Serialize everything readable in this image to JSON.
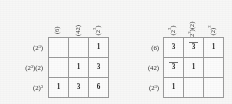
{
  "document": {
    "kind": "mathematical-matrix-pair",
    "notation": "integer-partition-cycle-type"
  },
  "matrices": [
    {
      "id": "left",
      "name": "left-matrix",
      "column_headers": [
        "(6)",
        "(42)",
        "(2³)"
      ],
      "row_labels": [
        "(2³)",
        "(2³)(2)",
        "(2)³"
      ],
      "cells": [
        [
          "",
          "",
          "1"
        ],
        [
          "",
          "1",
          "3"
        ],
        [
          "1",
          "3",
          "6"
        ]
      ],
      "struck": [
        [
          false,
          false,
          false
        ],
        [
          false,
          false,
          false
        ],
        [
          false,
          false,
          false
        ]
      ]
    },
    {
      "id": "right",
      "name": "right-matrix",
      "column_headers": [
        "(2³)",
        "(2³)(2)",
        "(2)³"
      ],
      "row_labels": [
        "(6)",
        "(42)",
        "(2³)"
      ],
      "cells": [
        [
          "3",
          "3",
          "1"
        ],
        [
          "3",
          "1",
          ""
        ],
        [
          "1",
          "",
          ""
        ]
      ],
      "struck": [
        [
          false,
          true,
          false
        ],
        [
          true,
          false,
          false
        ],
        [
          false,
          false,
          false
        ]
      ]
    }
  ],
  "chart_data": {
    "type": "table",
    "title": "",
    "tables": [
      {
        "name": "left-matrix",
        "columns": [
          "(6)",
          "(42)",
          "(2^3)"
        ],
        "rows": [
          "(2^3)",
          "(2^3)(2)",
          "(2)^3"
        ],
        "values": [
          [
            null,
            null,
            1
          ],
          [
            null,
            1,
            3
          ],
          [
            1,
            3,
            6
          ]
        ]
      },
      {
        "name": "right-matrix",
        "columns": [
          "(2^3)",
          "(2^3)(2)",
          "(2)^3"
        ],
        "rows": [
          "(6)",
          "(42)",
          "(2^3)"
        ],
        "values": [
          [
            3,
            3,
            1
          ],
          [
            3,
            1,
            null
          ],
          [
            1,
            null,
            null
          ]
        ]
      }
    ]
  },
  "style": {
    "border_color": "#9a9a9a",
    "text_color": "#1f1f1f",
    "background": "#fbfbfa"
  }
}
